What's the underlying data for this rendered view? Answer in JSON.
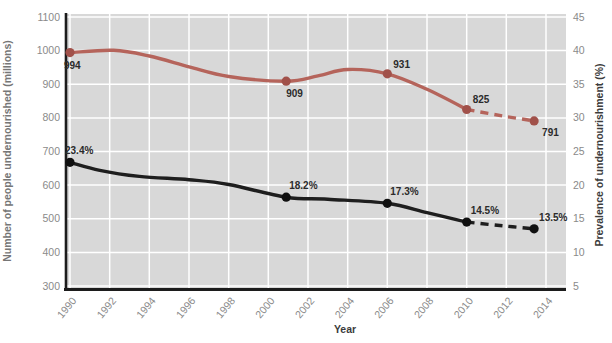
{
  "chart_data": {
    "type": "line",
    "title": "",
    "xlabel": "Year",
    "ylabel_left": "Number of people undernourished (millions)",
    "ylabel_right": "Prevalence of undernourishment (%)",
    "x_ticks": [
      1990,
      1992,
      1994,
      1996,
      1998,
      2000,
      2002,
      2004,
      2006,
      2008,
      2010,
      2012,
      2014
    ],
    "y_left_ticks": [
      300,
      400,
      500,
      600,
      700,
      800,
      900,
      1000,
      1100
    ],
    "y_right_ticks": [
      5,
      10,
      15,
      20,
      25,
      30,
      35,
      40,
      45
    ],
    "y_left_range": [
      300,
      1100
    ],
    "y_right_range": [
      5,
      45
    ],
    "x_range": [
      1989.8,
      2015.0
    ],
    "grid": true,
    "plot_background": "#d8d8d8",
    "grid_color": "#ffffff",
    "axis_line_color": "#1c1c1c",
    "tick_label_color": "#8a8a8a",
    "data_label_color": "#2b2b2b",
    "series": [
      {
        "id": "undernourished-millions",
        "name": "Number of people undernourished (millions)",
        "axis": "left",
        "line_color": "#b5645b",
        "marker_color": "#a1514a",
        "curve_anchors": [
          [
            1990,
            994
          ],
          [
            1992.2,
            1001
          ],
          [
            1994,
            984
          ],
          [
            1996,
            952
          ],
          [
            1998,
            923
          ],
          [
            2000.9,
            909
          ],
          [
            2002.5,
            925
          ],
          [
            2004,
            944
          ],
          [
            2006,
            931
          ],
          [
            2008,
            885
          ],
          [
            2010,
            825
          ]
        ],
        "dashed_anchors": [
          [
            2010,
            825
          ],
          [
            2011.8,
            806
          ],
          [
            2013.4,
            791
          ]
        ],
        "markers": [
          {
            "x": 1990,
            "y": 994,
            "label": "994",
            "dx": -6,
            "dy": 16
          },
          {
            "x": 2000.9,
            "y": 909,
            "label": "909",
            "dx": 0,
            "dy": 16
          },
          {
            "x": 2006,
            "y": 931,
            "label": "931",
            "dx": 6,
            "dy": -6
          },
          {
            "x": 2010,
            "y": 825,
            "label": "825",
            "dx": 6,
            "dy": -7
          },
          {
            "x": 2013.4,
            "y": 791,
            "label": "791",
            "dx": 8,
            "dy": 15
          }
        ]
      },
      {
        "id": "prevalence-percent",
        "name": "Prevalence of undernourishment (%)",
        "axis": "right",
        "line_color": "#1e1e1e",
        "marker_color": "#101010",
        "curve_anchors": [
          [
            1990,
            23.4
          ],
          [
            1991.5,
            22.2
          ],
          [
            1993.5,
            21.3
          ],
          [
            1996,
            20.8
          ],
          [
            1998,
            20.1
          ],
          [
            2000.9,
            18.2
          ],
          [
            2003,
            17.9
          ],
          [
            2006,
            17.3
          ],
          [
            2008,
            15.9
          ],
          [
            2010,
            14.5
          ]
        ],
        "dashed_anchors": [
          [
            2010,
            14.5
          ],
          [
            2011.8,
            13.95
          ],
          [
            2013.4,
            13.5
          ]
        ],
        "markers": [
          {
            "x": 1990,
            "y": 23.4,
            "label": "23.4%",
            "dx": -5,
            "dy": -8
          },
          {
            "x": 2000.9,
            "y": 18.2,
            "label": "18.2%",
            "dx": 3,
            "dy": -8
          },
          {
            "x": 2006,
            "y": 17.3,
            "label": "17.3%",
            "dx": 3,
            "dy": -8
          },
          {
            "x": 2010,
            "y": 14.5,
            "label": "14.5%",
            "dx": 4,
            "dy": -8
          },
          {
            "x": 2013.4,
            "y": 13.5,
            "label": "13.5%",
            "dx": 5,
            "dy": -8
          }
        ]
      }
    ]
  }
}
